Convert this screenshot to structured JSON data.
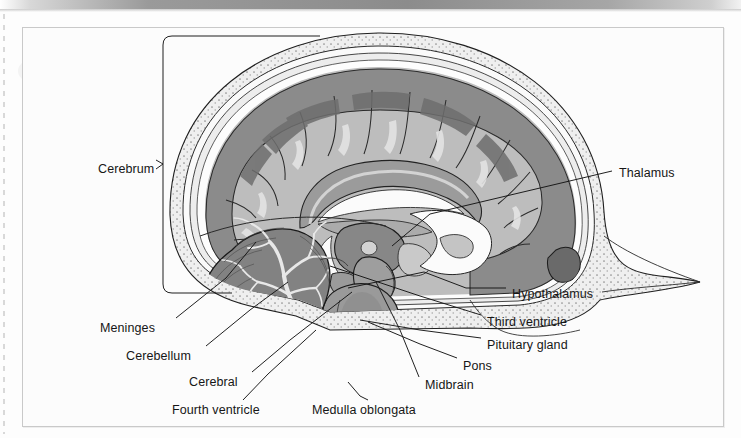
{
  "page": {
    "background_color": "#fdfdfd",
    "frame_border_color": "#c9c9c9"
  },
  "topbar": {
    "name": "gray-gradient-bar"
  },
  "diagram": {
    "kind": "anatomical-illustration",
    "style": "grayscale line-and-tone drawing",
    "palette": {
      "skull_bone": "#efefef",
      "cortex_gray_matter": "#8d8d8d",
      "cortex_dark": "#6f6f6f",
      "white_matter": "#b9b9b9",
      "ventricle_csf": "#fbfbfb",
      "cerebellum": "#8a8a8a",
      "brainstem": "#a5a5a5",
      "outline": "#1a1a1a"
    },
    "labels": [
      {
        "id": "cerebrum",
        "text": "Cerebrum",
        "x": 98,
        "y": 163,
        "anchor": "right",
        "connector": "bracket"
      },
      {
        "id": "thalamus",
        "text": "Thalamus",
        "x": 619,
        "y": 167,
        "anchor": "left",
        "connector": "horizontal-leader"
      },
      {
        "id": "hypothalamus",
        "text": "Hypothalamus",
        "x": 512,
        "y": 288,
        "anchor": "left",
        "connector": "leader"
      },
      {
        "id": "third-ventricle",
        "text": "Third ventricle",
        "x": 487,
        "y": 316,
        "anchor": "left",
        "connector": "leader"
      },
      {
        "id": "pituitary-gland",
        "text": "Pituitary gland",
        "x": 487,
        "y": 339,
        "anchor": "left",
        "connector": "leader"
      },
      {
        "id": "pons",
        "text": "Pons",
        "x": 463,
        "y": 360,
        "anchor": "left",
        "connector": "leader"
      },
      {
        "id": "midbrain",
        "text": "Midbrain",
        "x": 425,
        "y": 379,
        "anchor": "left",
        "connector": "leader"
      },
      {
        "id": "medulla-oblongata",
        "text": "Medulla oblongata",
        "x": 312,
        "y": 404,
        "anchor": "left",
        "connector": "leader"
      },
      {
        "id": "fourth-ventricle",
        "text": "Fourth ventricle",
        "x": 172,
        "y": 404,
        "anchor": "right",
        "connector": "leader"
      },
      {
        "id": "cerebral",
        "text": "Cerebral",
        "x": 189,
        "y": 376,
        "anchor": "right",
        "connector": "leader"
      },
      {
        "id": "cerebellum",
        "text": "Cerebellum",
        "x": 126,
        "y": 350,
        "anchor": "right",
        "connector": "leader"
      },
      {
        "id": "meninges",
        "text": "Meninges",
        "x": 100,
        "y": 322,
        "anchor": "right",
        "connector": "leader"
      }
    ],
    "structures": [
      "skull",
      "meninges",
      "cerebral cortex",
      "corpus callosum",
      "lateral ventricle",
      "thalamus",
      "hypothalamus",
      "third ventricle",
      "pituitary gland",
      "midbrain",
      "pons",
      "medulla oblongata",
      "cerebellum",
      "arbor vitae",
      "fourth ventricle",
      "spinal cord"
    ]
  }
}
